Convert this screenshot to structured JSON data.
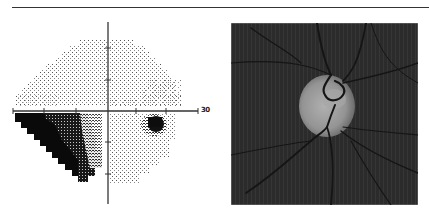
{
  "figure": {
    "left_panel": {
      "type": "visual-field-grayscale-plot",
      "axis_label": "30",
      "axis_color": "#333333",
      "center": [
        108,
        111
      ],
      "tick_spacing_px": 32,
      "defects": {
        "inferior_nasal_dense": "black staircase region lower-left quadrant",
        "inferior_temporal_scotoma": "dark cluster right of fixation below horizontal meridian"
      }
    },
    "right_panel": {
      "type": "optic-disc-photograph",
      "background_color": "#2a2a2a",
      "disc_color": "#9a9a9a"
    },
    "top_rule_color": "#333333"
  }
}
